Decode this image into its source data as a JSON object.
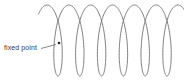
{
  "diagram": {
    "type": "prolate trochoid (looping curve)",
    "label": "fixed point",
    "curve": {
      "x0": 47.1,
      "advance_per_radian": 3.47,
      "loop_half_width": 9,
      "center_y": 40.5,
      "half_height": 35.5,
      "t_start": -0.75,
      "t_end": 39.5,
      "loops": 6,
      "stroke_color": "#6e6e6e"
    },
    "fixed_point": {
      "x": 59,
      "y": 43,
      "color": "#222222"
    },
    "leader_line": {
      "x1": 41,
      "y1": 48.5,
      "x2": 56,
      "y2": 44.5,
      "color": "#555555"
    }
  }
}
